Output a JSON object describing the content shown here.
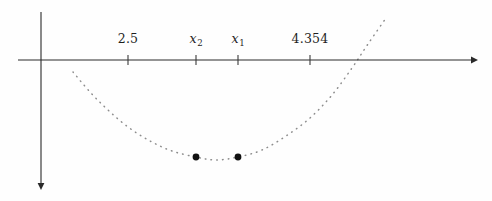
{
  "figure": {
    "name": "quadratic-roots-number-line",
    "background_color": "#fefefe",
    "width": 492,
    "height": 201
  },
  "axes": {
    "x_axis": {
      "label": "x-axis",
      "y_pixel": 60,
      "x_start_pixel": 18,
      "x_end_pixel": 478,
      "arrow_direction": "right",
      "color": "#2a2a2a"
    },
    "y_axis": {
      "label": "y-axis",
      "x_pixel": 41,
      "y_start_pixel": 12,
      "y_end_pixel": 190,
      "arrow_direction": "down",
      "color": "#2a2a2a"
    }
  },
  "ticks": [
    {
      "label": "2.5",
      "is_variable": false,
      "base": "2.5",
      "subscript": "",
      "x_pixel": 128
    },
    {
      "label": "x2",
      "is_variable": true,
      "base": "x",
      "subscript": "2",
      "x_pixel": 196
    },
    {
      "label": "x1",
      "is_variable": true,
      "base": "x",
      "subscript": "1",
      "x_pixel": 238
    },
    {
      "label": "4.354",
      "is_variable": false,
      "base": "4.354",
      "subscript": "",
      "x_pixel": 310
    }
  ],
  "chart_data": {
    "type": "line",
    "title": "",
    "xlabel": "",
    "ylabel": "",
    "style": "dotted-parabola-with-marked-roots",
    "curve_color": "#8d8d8d",
    "marker_color": "#111111",
    "vertex_pixel": {
      "x": 216,
      "y": 160
    },
    "curve_points_pixel": [
      {
        "x": 73,
        "y": 72
      },
      {
        "x": 90,
        "y": 92
      },
      {
        "x": 108,
        "y": 110
      },
      {
        "x": 128,
        "y": 127
      },
      {
        "x": 150,
        "y": 141
      },
      {
        "x": 172,
        "y": 151
      },
      {
        "x": 196,
        "y": 157
      },
      {
        "x": 216,
        "y": 160
      },
      {
        "x": 238,
        "y": 157
      },
      {
        "x": 262,
        "y": 150
      },
      {
        "x": 286,
        "y": 136
      },
      {
        "x": 310,
        "y": 118
      },
      {
        "x": 332,
        "y": 95
      },
      {
        "x": 352,
        "y": 68
      },
      {
        "x": 368,
        "y": 44
      },
      {
        "x": 386,
        "y": 18
      }
    ],
    "markers": [
      {
        "name": "x2-point",
        "x_pixel": 196,
        "y_pixel": 157,
        "radius": 3.4
      },
      {
        "name": "x1-point",
        "x_pixel": 238,
        "y_pixel": 157,
        "radius": 3.4
      }
    ],
    "tick_labels": [
      "2.5",
      "x2",
      "x1",
      "4.354"
    ],
    "legend": [],
    "grid": false
  }
}
